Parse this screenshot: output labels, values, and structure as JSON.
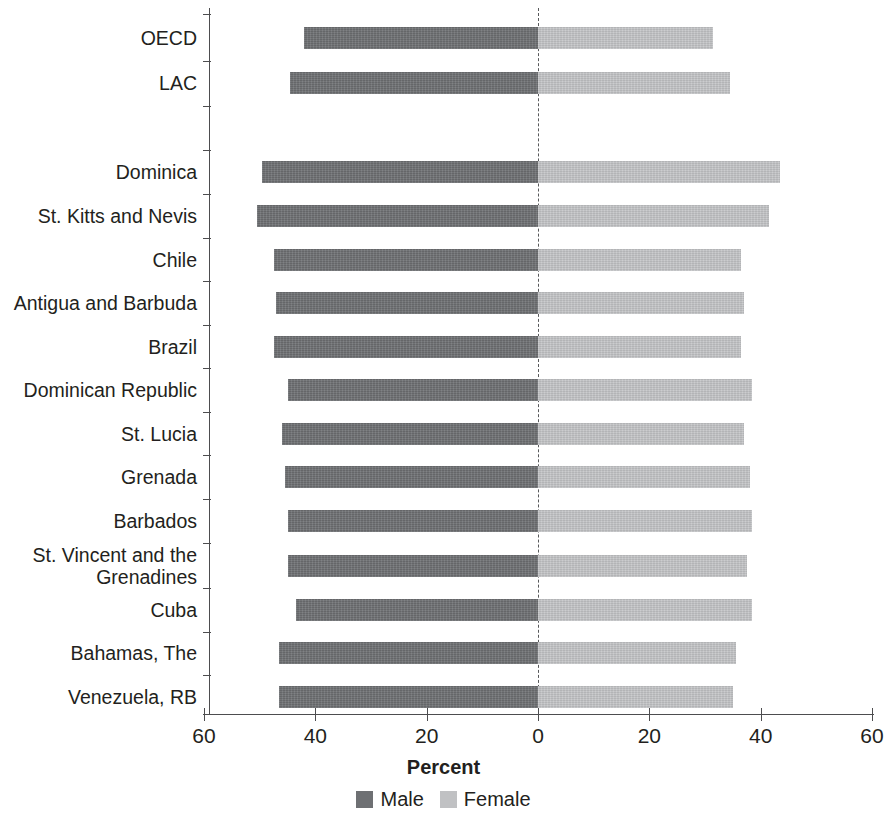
{
  "chart_data": {
    "type": "bar",
    "subtype": "diverging-horizontal-bar",
    "title": "",
    "xlabel": "Percent",
    "ylabel": "",
    "xlim": [
      -60,
      60
    ],
    "xticks": [
      60,
      40,
      20,
      0,
      20,
      40,
      60
    ],
    "grid": false,
    "zero_reference_line": true,
    "legend_position": "bottom",
    "legend": [
      "Male",
      "Female"
    ],
    "note": "Male values plotted to the left of zero, Female values to the right.",
    "categories": [
      "OECD",
      "LAC",
      "Dominica",
      "St. Kitts and Nevis",
      "Chile",
      "Antigua and Barbuda",
      "Brazil",
      "Dominican Republic",
      "St. Lucia",
      "Grenada",
      "Barbados",
      "St. Vincent and the\nGrenadines",
      "Cuba",
      "Bahamas, The",
      "Venezuela, RB"
    ],
    "series": [
      {
        "name": "Male",
        "color": "#6e7073",
        "values": [
          42.0,
          44.5,
          49.6,
          50.5,
          47.5,
          47.0,
          47.5,
          45.0,
          46.0,
          45.5,
          45.0,
          45.0,
          43.5,
          46.5,
          46.5
        ]
      },
      {
        "name": "Female",
        "color": "#c0c1c3",
        "values": [
          31.5,
          34.5,
          43.5,
          41.5,
          36.5,
          37.0,
          36.5,
          38.5,
          37.0,
          38.0,
          38.5,
          37.5,
          38.5,
          35.5,
          35.0
        ]
      }
    ]
  },
  "axis": {
    "tick_labels": [
      "60",
      "40",
      "20",
      "0",
      "20",
      "40",
      "60"
    ],
    "title": "Percent"
  },
  "legend": {
    "items": [
      {
        "label": "Male",
        "color": "#6e7073",
        "icon": "square-swatch-icon"
      },
      {
        "label": "Female",
        "color": "#c0c1c3",
        "icon": "square-swatch-icon"
      }
    ]
  }
}
